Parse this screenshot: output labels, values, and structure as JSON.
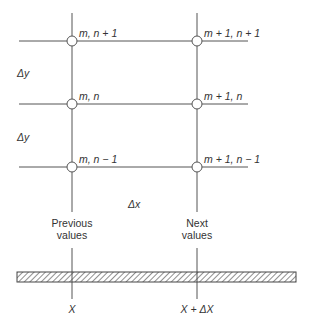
{
  "grid": {
    "nodes": [
      {
        "id": "m_np1",
        "label": "m, n + 1",
        "x": 72,
        "y": 41
      },
      {
        "id": "mp1_np1",
        "label": "m + 1, n + 1",
        "x": 197,
        "y": 41
      },
      {
        "id": "m_n",
        "label": "m, n",
        "x": 72,
        "y": 104
      },
      {
        "id": "mp1_n",
        "label": "m + 1, n",
        "x": 197,
        "y": 104
      },
      {
        "id": "m_nm1",
        "label": "m, n − 1",
        "x": 72,
        "y": 167
      },
      {
        "id": "mp1_nm1",
        "label": "m + 1, n − 1",
        "x": 197,
        "y": 167
      }
    ],
    "spacing_labels": {
      "dy_upper": "Δy",
      "dy_lower": "Δy",
      "dx": "Δx"
    }
  },
  "columns": {
    "previous": {
      "line1": "Previous",
      "line2": "values"
    },
    "next": {
      "line1": "Next",
      "line2": "values"
    }
  },
  "axis": {
    "x_left": "X",
    "x_right": "X + ΔX"
  },
  "colors": {
    "line": "#555555",
    "text": "#333333"
  }
}
